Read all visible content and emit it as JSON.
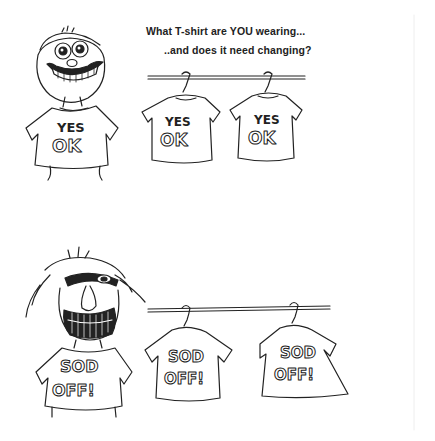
{
  "caption": {
    "line1": "What T-shirt are YOU wearing...",
    "line2": "..and does it need changing?"
  },
  "top_panel": {
    "character": "grinning-man",
    "shirt_text": {
      "top": "YES",
      "bottom": "OK"
    },
    "hanging_shirts": [
      {
        "top": "YES",
        "bottom": "OK"
      },
      {
        "top": "YES",
        "bottom": "OK"
      }
    ]
  },
  "bottom_panel": {
    "character": "angry-man",
    "shirt_text": {
      "top": "SOD",
      "bottom": "OFF!"
    },
    "hanging_shirts": [
      {
        "top": "SOD",
        "bottom": "OFF!"
      },
      {
        "top": "SOD",
        "bottom": "OFF!"
      }
    ]
  },
  "colors": {
    "ink": "#222222",
    "background": "#ffffff"
  }
}
